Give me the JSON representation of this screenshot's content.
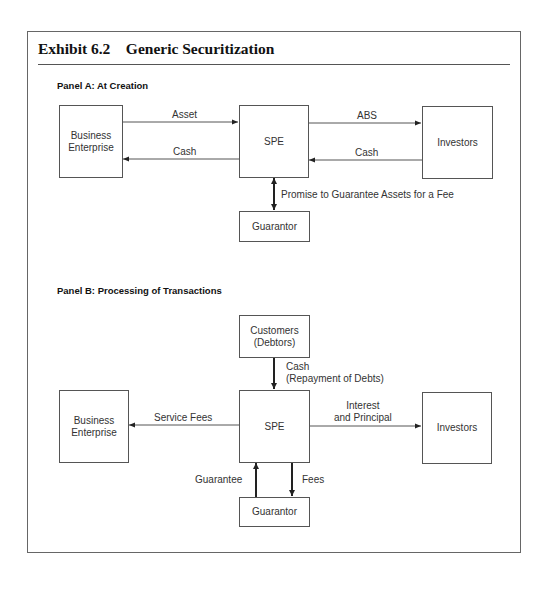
{
  "exhibit": {
    "title": "Exhibit 6.2    Generic Securitization"
  },
  "panel_a": {
    "label": "Panel A:  At Creation",
    "nodes": {
      "business": "Business\nEnterprise",
      "spe": "SPE",
      "investors": "Investors",
      "guarantor": "Guarantor"
    },
    "edges": {
      "asset": "Asset",
      "cash_to_business": "Cash",
      "abs": "ABS",
      "cash_from_investors": "Cash",
      "guarantee_promise": "Promise to Guarantee Assets for a Fee"
    }
  },
  "panel_b": {
    "label": "Panel B:  Processing of Transactions",
    "nodes": {
      "customers": "Customers\n(Debtors)",
      "business": "Business\nEnterprise",
      "spe": "SPE",
      "investors": "Investors",
      "guarantor": "Guarantor"
    },
    "edges": {
      "cash_repayment": "Cash\n(Repayment of Debts)",
      "service_fees": "Service Fees",
      "interest_principal": "Interest\nand Principal",
      "guarantee": "Guarantee",
      "fees": "Fees"
    }
  },
  "colors": {
    "stroke": "#555555",
    "arrow": "#222222",
    "text": "#333333",
    "background": "#ffffff"
  }
}
